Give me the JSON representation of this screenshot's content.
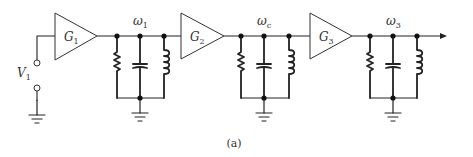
{
  "diagram": {
    "type": "cascaded tuned amplifier schematic",
    "caption": "(a)",
    "input": {
      "label": "V",
      "subscript": "1"
    },
    "stages": [
      {
        "amp_label": "G",
        "amp_sub": "1",
        "tank_label": "ω",
        "tank_sub": "1",
        "tank_components": [
          "resistor",
          "capacitor",
          "inductor"
        ]
      },
      {
        "amp_label": "G",
        "amp_sub": "2",
        "tank_label": "ω",
        "tank_sub": "c",
        "tank_components": [
          "resistor",
          "capacitor",
          "inductor"
        ]
      },
      {
        "amp_label": "G",
        "amp_sub": "3",
        "tank_label": "ω",
        "tank_sub": "3",
        "tank_components": [
          "resistor",
          "capacitor",
          "inductor"
        ]
      }
    ],
    "output": {
      "symbol": "arrow"
    },
    "colors": {
      "line": "#222222",
      "background": "#ffffff"
    }
  }
}
